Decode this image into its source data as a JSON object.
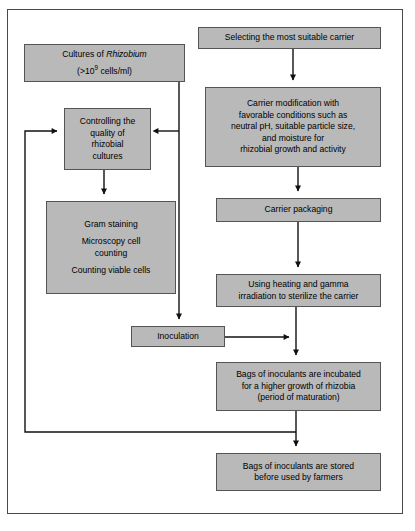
{
  "diagram": {
    "fill_color": "#b9b9b9",
    "border_color": "#545454",
    "line_color": "#111111",
    "frame_color": "#4a4a4a"
  },
  "nodes": {
    "selecting_carrier": {
      "label": "Selecting the most suitable carrier",
      "x": 198,
      "y": 27,
      "w": 183,
      "h": 22
    },
    "cultures_rhizobium": {
      "line1_a": "Cultures of ",
      "line1_b": "Rhizobium",
      "line2_a": "(>10",
      "line2_sup": "9",
      "line2_b": " cells/ml)",
      "x": 24,
      "y": 44,
      "w": 161,
      "h": 38
    },
    "carrier_modification": {
      "lines": [
        "Carrier modification with",
        "favorable conditions such as",
        "neutral pH, suitable particle size,",
        "and moisture for",
        "rhizobial growth and activity"
      ],
      "x": 205,
      "y": 87,
      "w": 176,
      "h": 80
    },
    "controlling_quality": {
      "lines": [
        "Controlling the",
        "quality of",
        "rhizobial",
        "cultures"
      ],
      "x": 64,
      "y": 108,
      "w": 87,
      "h": 62
    },
    "gram_staining": {
      "group1": [
        "Gram staining"
      ],
      "group2": [
        "Microscopy cell",
        "counting"
      ],
      "group3": [
        "Counting viable cells"
      ],
      "x": 46,
      "y": 201,
      "w": 130,
      "h": 93
    },
    "carrier_packaging": {
      "label": "Carrier packaging",
      "x": 216,
      "y": 198,
      "w": 165,
      "h": 24
    },
    "sterilize_carrier": {
      "lines": [
        "Using heating and gamma",
        "irradiation to sterilize the carrier"
      ],
      "x": 216,
      "y": 274,
      "w": 165,
      "h": 33
    },
    "inoculation": {
      "label": "Inoculation",
      "x": 131,
      "y": 326,
      "w": 94,
      "h": 21
    },
    "bags_incubated": {
      "lines": [
        "Bags of inoculants are incubated",
        "for a higher growth of rhizobia",
        "(period of maturation)"
      ],
      "x": 216,
      "y": 362,
      "w": 165,
      "h": 49
    },
    "bags_stored": {
      "lines": [
        "Bags of inoculants are stored",
        "before used by farmers"
      ],
      "x": 216,
      "y": 453,
      "w": 165,
      "h": 38
    }
  },
  "connectors": [
    {
      "name": "selecting-to-modification",
      "kind": "arrow-down"
    },
    {
      "name": "modification-to-packaging",
      "kind": "arrow-down"
    },
    {
      "name": "packaging-to-sterilize",
      "kind": "arrow-down"
    },
    {
      "name": "sterilize-to-incubated",
      "kind": "arrow-down"
    },
    {
      "name": "cultures-to-inoculation-trunk",
      "kind": "arrow-down"
    },
    {
      "name": "trunk-to-controlling",
      "kind": "arrow-left"
    },
    {
      "name": "controlling-to-gram-staining",
      "kind": "arrow-down"
    },
    {
      "name": "inoculation-to-trunk",
      "kind": "arrow-right"
    },
    {
      "name": "incubated-to-stored",
      "kind": "arrow-down"
    },
    {
      "name": "feedback-loop-to-controlling",
      "kind": "arrow-right"
    }
  ]
}
